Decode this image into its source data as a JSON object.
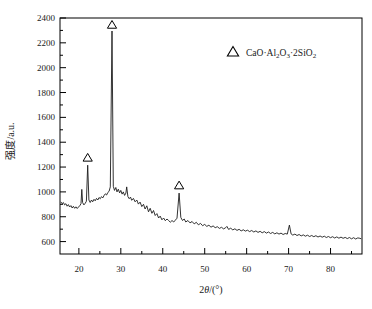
{
  "figure": {
    "background": "#ffffff",
    "curve_color": "#1c1c1c",
    "axis_color": "#000000",
    "marker_style": "open-triangle"
  },
  "chart_data": {
    "type": "line",
    "title": "",
    "xlabel": "2θ/(°)",
    "xlabel_parts": [
      {
        "text": "2"
      },
      {
        "text": "θ",
        "italic": true
      },
      {
        "text": "/(°)"
      }
    ],
    "ylabel": "强度/a.u.",
    "xlim": [
      15.5,
      87.5
    ],
    "ylim": [
      500,
      2400
    ],
    "grid": false,
    "x_major_ticks": [
      20,
      30,
      40,
      50,
      60,
      70,
      80
    ],
    "x_minor_ticks": [
      25,
      35,
      45,
      55,
      65,
      75,
      85
    ],
    "y_major_ticks": [
      600,
      800,
      1000,
      1200,
      1400,
      1600,
      1800,
      2000,
      2200,
      2400
    ],
    "y_minor_ticks": [
      700,
      900,
      1100,
      1300,
      1500,
      1700,
      1900,
      2100,
      2300
    ],
    "legend": {
      "position": "upper right",
      "marker": "open-triangle",
      "label": "CaO·Al₂O₃·2SiO₂",
      "label_parts": [
        {
          "text": "CaO·Al"
        },
        {
          "text": "2",
          "sub": true
        },
        {
          "text": "O"
        },
        {
          "text": "3",
          "sub": true
        },
        {
          "text": "·2SiO"
        },
        {
          "text": "2",
          "sub": true
        }
      ]
    },
    "peak_markers": [
      {
        "x": 22.1,
        "y": 1275,
        "marker": "open-triangle"
      },
      {
        "x": 27.9,
        "y": 2345,
        "marker": "open-triangle"
      },
      {
        "x": 43.9,
        "y": 1052,
        "marker": "open-triangle"
      }
    ],
    "series": [
      {
        "name": "XRD pattern",
        "points": [
          [
            15.7,
            920
          ],
          [
            16,
            905
          ],
          [
            16.3,
            915
          ],
          [
            16.6,
            895
          ],
          [
            16.9,
            905
          ],
          [
            17.2,
            885
          ],
          [
            17.5,
            898
          ],
          [
            17.8,
            878
          ],
          [
            18.1,
            890
          ],
          [
            18.4,
            870
          ],
          [
            18.7,
            884
          ],
          [
            19,
            868
          ],
          [
            19.3,
            880
          ],
          [
            19.6,
            866
          ],
          [
            19.9,
            878
          ],
          [
            20.2,
            888
          ],
          [
            20.5,
            905
          ],
          [
            20.7,
            1020
          ],
          [
            20.9,
            915
          ],
          [
            21.2,
            895
          ],
          [
            21.5,
            908
          ],
          [
            21.8,
            925
          ],
          [
            22.1,
            1215
          ],
          [
            22.4,
            935
          ],
          [
            22.7,
            915
          ],
          [
            23,
            935
          ],
          [
            23.3,
            920
          ],
          [
            23.6,
            940
          ],
          [
            23.9,
            928
          ],
          [
            24.2,
            948
          ],
          [
            24.5,
            935
          ],
          [
            24.8,
            955
          ],
          [
            25.1,
            945
          ],
          [
            25.4,
            962
          ],
          [
            25.7,
            952
          ],
          [
            26,
            970
          ],
          [
            26.3,
            985
          ],
          [
            26.6,
            975
          ],
          [
            26.9,
            995
          ],
          [
            27.2,
            1005
          ],
          [
            27.5,
            1040
          ],
          [
            27.9,
            2295
          ],
          [
            28.2,
            1045
          ],
          [
            28.5,
            1012
          ],
          [
            28.8,
            1035
          ],
          [
            29.1,
            1000
          ],
          [
            29.4,
            1022
          ],
          [
            29.7,
            992
          ],
          [
            30,
            1012
          ],
          [
            30.3,
            982
          ],
          [
            30.6,
            1000
          ],
          [
            30.9,
            972
          ],
          [
            31.2,
            990
          ],
          [
            31.4,
            1040
          ],
          [
            31.7,
            962
          ],
          [
            32,
            945
          ],
          [
            32.3,
            958
          ],
          [
            32.6,
            932
          ],
          [
            33,
            948
          ],
          [
            33.4,
            920
          ],
          [
            33.8,
            935
          ],
          [
            34.2,
            902
          ],
          [
            34.6,
            918
          ],
          [
            35,
            882
          ],
          [
            35.4,
            900
          ],
          [
            35.8,
            862
          ],
          [
            36.2,
            888
          ],
          [
            36.6,
            840
          ],
          [
            37,
            868
          ],
          [
            37.4,
            828
          ],
          [
            37.8,
            850
          ],
          [
            38.2,
            810
          ],
          [
            38.6,
            825
          ],
          [
            39,
            790
          ],
          [
            39.4,
            805
          ],
          [
            39.8,
            775
          ],
          [
            40.2,
            790
          ],
          [
            40.6,
            768
          ],
          [
            41,
            782
          ],
          [
            41.4,
            770
          ],
          [
            41.8,
            756
          ],
          [
            42.2,
            770
          ],
          [
            42.6,
            758
          ],
          [
            43,
            772
          ],
          [
            43.4,
            788
          ],
          [
            43.9,
            990
          ],
          [
            44.3,
            795
          ],
          [
            44.7,
            770
          ],
          [
            45.1,
            782
          ],
          [
            45.5,
            758
          ],
          [
            46,
            770
          ],
          [
            46.5,
            750
          ],
          [
            47,
            762
          ],
          [
            47.5,
            742
          ],
          [
            48,
            755
          ],
          [
            48.5,
            735
          ],
          [
            49,
            746
          ],
          [
            49.5,
            728
          ],
          [
            50,
            738
          ],
          [
            50.5,
            722
          ],
          [
            51,
            732
          ],
          [
            51.5,
            716
          ],
          [
            52,
            726
          ],
          [
            52.5,
            712
          ],
          [
            53,
            720
          ],
          [
            53.5,
            706
          ],
          [
            54,
            715
          ],
          [
            54.5,
            702
          ],
          [
            55,
            712
          ],
          [
            55.3,
            722
          ],
          [
            55.7,
            698
          ],
          [
            56.2,
            708
          ],
          [
            56.7,
            694
          ],
          [
            57.2,
            703
          ],
          [
            57.7,
            690
          ],
          [
            58.2,
            699
          ],
          [
            58.7,
            686
          ],
          [
            59.2,
            695
          ],
          [
            59.7,
            684
          ],
          [
            60.2,
            692
          ],
          [
            60.7,
            680
          ],
          [
            61.2,
            689
          ],
          [
            61.7,
            677
          ],
          [
            62.2,
            686
          ],
          [
            62.7,
            674
          ],
          [
            63.2,
            683
          ],
          [
            63.7,
            671
          ],
          [
            64.2,
            680
          ],
          [
            64.7,
            668
          ],
          [
            65.2,
            677
          ],
          [
            65.7,
            665
          ],
          [
            66.2,
            674
          ],
          [
            66.7,
            662
          ],
          [
            67.2,
            671
          ],
          [
            67.7,
            660
          ],
          [
            68.2,
            668
          ],
          [
            68.7,
            657
          ],
          [
            69.2,
            665
          ],
          [
            69.7,
            660
          ],
          [
            70.2,
            733
          ],
          [
            70.6,
            662
          ],
          [
            71,
            652
          ],
          [
            71.5,
            660
          ],
          [
            72,
            649
          ],
          [
            72.5,
            657
          ],
          [
            73,
            646
          ],
          [
            73.5,
            654
          ],
          [
            74,
            643
          ],
          [
            74.5,
            651
          ],
          [
            75,
            641
          ],
          [
            75.5,
            649
          ],
          [
            76,
            639
          ],
          [
            76.5,
            647
          ],
          [
            77,
            637
          ],
          [
            77.5,
            645
          ],
          [
            78,
            635
          ],
          [
            78.5,
            643
          ],
          [
            79,
            633
          ],
          [
            79.5,
            641
          ],
          [
            80,
            631
          ],
          [
            80.5,
            639
          ],
          [
            81,
            629
          ],
          [
            81.5,
            638
          ],
          [
            82,
            627
          ],
          [
            82.5,
            636
          ],
          [
            83,
            626
          ],
          [
            83.5,
            634
          ],
          [
            84,
            624
          ],
          [
            84.5,
            633
          ],
          [
            85,
            622
          ],
          [
            85.5,
            631
          ],
          [
            86,
            621
          ],
          [
            86.5,
            630
          ],
          [
            87,
            626
          ],
          [
            87.3,
            622
          ]
        ]
      }
    ]
  }
}
